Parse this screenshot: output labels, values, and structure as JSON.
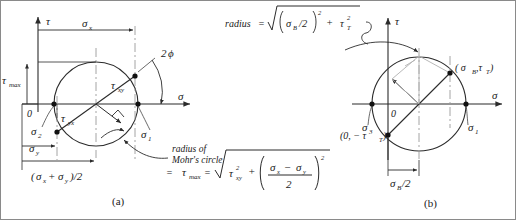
{
  "figure": {
    "type": "mohrs-circle-diagram",
    "caption_a": "(a)",
    "caption_b": "(b)",
    "line_color": "#2b2b2b",
    "dash_color": "#9a9a9a",
    "accent_color": "#b0b0b0"
  },
  "panel_a": {
    "axis_tau": "τ",
    "axis_sigma": "σ",
    "origin": "0",
    "tau_max": "τ",
    "tau_max_sub": "max",
    "sigma_x": "σ",
    "sigma_x_sub": "x",
    "sigma_y": "σ",
    "sigma_y_sub": "y",
    "sigma_1": "σ",
    "sigma_1_sub": "1",
    "sigma_2": "σ",
    "sigma_2_sub": "2",
    "tau_xy": "τ",
    "tau_xy_sub": "xy",
    "tau_yx": "τ",
    "tau_yx_sub": "yx",
    "angle_label": "2",
    "angle_symbol": "ϕ",
    "center_label_open": "(",
    "center_label": "σ",
    "center_sub_x": "x",
    "center_plus": "+",
    "center_label2": "σ",
    "center_sub_y": "y",
    "center_close": ")/2",
    "note_line1": "radius of",
    "note_line2": "Mohr's circle",
    "formula_eq1": "=",
    "formula_taumax": "τ",
    "formula_taumax_sub": "max",
    "formula_eq2": "=",
    "formula_radicand_tau": "τ",
    "formula_radicand_tau_sub": "xy",
    "formula_radicand_tau_pow": "2",
    "formula_plus": "+",
    "formula_num_s1": "σ",
    "formula_num_s1_sub": "x",
    "formula_minus": "−",
    "formula_num_s2": "σ",
    "formula_num_s2_sub": "y",
    "formula_den": "2",
    "formula_group_pow": "2"
  },
  "panel_b": {
    "axis_tau": "τ",
    "axis_sigma": "σ",
    "origin": "0",
    "sigma_1": "σ",
    "sigma_1_sub": "1",
    "sigma_3": "σ",
    "sigma_3_sub": "3",
    "point_top": "( σ",
    "point_top_sub1": "B",
    "point_top_mid": ",τ",
    "point_top_sub2": "T",
    "point_top_end": " )",
    "point_bottom": "(0, − τ",
    "point_bottom_sub": "T",
    "point_bottom_end": ")",
    "sigma_b_half": "σ",
    "sigma_b_half_sub": "B",
    "sigma_b_half_end": "/2",
    "radius_word": "radius",
    "radius_eq": "=",
    "radius_num_s": "σ",
    "radius_num_s_sub": "B",
    "radius_num_div": "/2",
    "radius_group_pow": "2",
    "radius_plus": "+",
    "radius_tau": "τ",
    "radius_tau_sub": "T",
    "radius_tau_pow": "2"
  }
}
